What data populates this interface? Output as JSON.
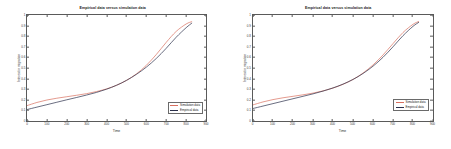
{
  "figure": {
    "background_color": "#ffffff",
    "axes_color": "#5a5a5a",
    "panels": [
      "left",
      "right"
    ]
  },
  "colors": {
    "simulation": "#d9705f",
    "empirical": "#2b2f4a"
  },
  "chart_data": [
    {
      "type": "line",
      "panel": "left",
      "title": "Empirical data versus simulation data",
      "xlabel": "Time",
      "ylabel": "Interest in migration",
      "xlim": [
        0,
        900
      ],
      "ylim": [
        0,
        1
      ],
      "grid": false,
      "legend_position": "lower right",
      "xticks": [
        0,
        100,
        200,
        300,
        400,
        500,
        600,
        700,
        800,
        900
      ],
      "xtick_labels": [
        "0",
        "100",
        "200",
        "300",
        "400",
        "500",
        "600",
        "700",
        "800",
        "900"
      ],
      "yticks": [
        0,
        0.1,
        0.2,
        0.3,
        0.4,
        0.5,
        0.6,
        0.7,
        0.8,
        0.9,
        1
      ],
      "ytick_labels": [
        "0",
        "0.1",
        "0.2",
        "0.3",
        "0.4",
        "0.5",
        "0.6",
        "0.7",
        "0.8",
        "0.9",
        "1"
      ],
      "x": [
        0,
        50,
        100,
        150,
        200,
        250,
        300,
        350,
        400,
        450,
        500,
        550,
        600,
        650,
        700,
        750,
        800,
        830
      ],
      "series": [
        {
          "name": "Simulation data",
          "color": "#d9705f",
          "values": [
            0.145,
            0.175,
            0.198,
            0.215,
            0.229,
            0.243,
            0.258,
            0.278,
            0.303,
            0.337,
            0.383,
            0.444,
            0.525,
            0.627,
            0.742,
            0.845,
            0.915,
            0.938
          ]
        },
        {
          "name": "Empirical data",
          "color": "#2b2f4a",
          "values": [
            0.108,
            0.131,
            0.154,
            0.177,
            0.2,
            0.222,
            0.245,
            0.27,
            0.3,
            0.337,
            0.383,
            0.44,
            0.508,
            0.59,
            0.686,
            0.79,
            0.88,
            0.925
          ]
        }
      ]
    },
    {
      "type": "line",
      "panel": "right",
      "title": "Empirical data versus simulation data",
      "xlabel": "Time",
      "ylabel": "Interest in migration",
      "xlim": [
        0,
        900
      ],
      "ylim": [
        0,
        1
      ],
      "grid": false,
      "legend_position": "lower right",
      "xticks": [
        0,
        100,
        200,
        300,
        400,
        500,
        600,
        700,
        800,
        900
      ],
      "xtick_labels": [
        "0",
        "100",
        "200",
        "300",
        "400",
        "500",
        "600",
        "700",
        "800",
        "900"
      ],
      "yticks": [
        0,
        0.1,
        0.2,
        0.3,
        0.4,
        0.5,
        0.6,
        0.7,
        0.8,
        0.9,
        1
      ],
      "ytick_labels": [
        "0",
        "0.1",
        "0.2",
        "0.3",
        "0.4",
        "0.5",
        "0.6",
        "0.7",
        "0.8",
        "0.9",
        "1"
      ],
      "x": [
        0,
        50,
        100,
        150,
        200,
        250,
        300,
        350,
        400,
        450,
        500,
        550,
        600,
        650,
        700,
        750,
        800,
        830
      ],
      "series": [
        {
          "name": "Simulation data",
          "color": "#d9705f",
          "values": [
            0.152,
            0.18,
            0.202,
            0.219,
            0.233,
            0.247,
            0.263,
            0.284,
            0.311,
            0.346,
            0.392,
            0.452,
            0.529,
            0.623,
            0.73,
            0.835,
            0.912,
            0.94
          ]
        },
        {
          "name": "Empirical data",
          "color": "#2b2f4a",
          "values": [
            0.118,
            0.141,
            0.164,
            0.187,
            0.21,
            0.233,
            0.256,
            0.282,
            0.312,
            0.348,
            0.392,
            0.448,
            0.517,
            0.601,
            0.7,
            0.805,
            0.893,
            0.932
          ]
        }
      ]
    }
  ]
}
